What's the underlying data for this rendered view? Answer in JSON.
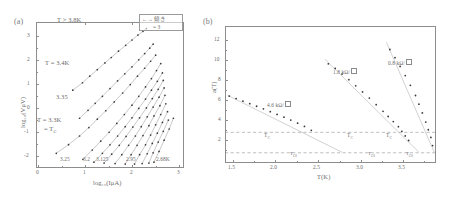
{
  "figure": {
    "panel_a_tag": "(a)",
    "panel_b_tag": "(b)"
  },
  "panel_a": {
    "xlabel": "log₁₀(IμA)",
    "ylabel": "log₁₀(VμV)",
    "xticks": [
      "0",
      "1",
      "2",
      "3"
    ],
    "yticks": [
      "3",
      "2",
      "1",
      "0",
      "-1",
      "-2"
    ],
    "annotations": {
      "top_left": "T > 3.8K",
      "upper": "T = 3.4K",
      "mid": "3.35",
      "lower_1": "T = 3.3K",
      "lower_2": "= T",
      "lower_2_sub": "C"
    },
    "curve_labels": [
      "3.25",
      "3.2",
      "3.125",
      "2.95",
      "2.68K"
    ],
    "legend": {
      "arrow_label": "←→ 傾き",
      "slope_value": "= 3"
    }
  },
  "panel_b": {
    "xlabel": "T(K)",
    "ylabel": "a(T)",
    "xticks": [
      "1.5",
      "2.0",
      "2.5",
      "3.0",
      "3.5"
    ],
    "yticks": [
      "12",
      "10",
      "8",
      "6",
      "4",
      "2"
    ],
    "series_labels": [
      "4.6 kΩ/",
      "1.8 kΩ/",
      "0.8 kΩ/"
    ],
    "markers": {
      "tc": "T",
      "tc_sub": "C",
      "tc0": "T",
      "tc0_sub": "C0"
    },
    "reference_lines": {
      "upper_value": "3",
      "lower_value": "1"
    }
  },
  "chart_data": [
    {
      "type": "line",
      "panel": "a",
      "title": "",
      "xlabel": "log10(I uA)",
      "ylabel": "log10(V uV)",
      "xlim": [
        -0.15,
        3.35
      ],
      "ylim": [
        -2.55,
        3.7
      ],
      "grid": false,
      "legend": "top-right",
      "note": "Log-log current-voltage isotherms; slope = 3 reference indicated in legend box",
      "series": [
        {
          "name": "T = 3.4K",
          "x": [
            0.72,
            0.95,
            1.12,
            1.3,
            1.48,
            1.63,
            1.8,
            1.97,
            2.12,
            2.26,
            2.38,
            2.46
          ],
          "y": [
            0.78,
            1.1,
            1.38,
            1.66,
            1.95,
            2.18,
            2.45,
            2.7,
            2.93,
            3.14,
            3.3,
            3.42
          ]
        },
        {
          "name": "3.35",
          "x": [
            0.88,
            1.08,
            1.25,
            1.42,
            1.6,
            1.78,
            1.95,
            2.12,
            2.28,
            2.42,
            2.54,
            2.62
          ],
          "y": [
            -0.42,
            -0.08,
            0.22,
            0.52,
            0.85,
            1.18,
            1.48,
            1.78,
            2.08,
            2.35,
            2.58,
            2.75
          ]
        },
        {
          "name": "T = 3.3K",
          "x": [
            0.33,
            0.62,
            0.88,
            1.1,
            1.3,
            1.5,
            1.7,
            1.9,
            2.08,
            2.25,
            2.42,
            2.56,
            2.68
          ],
          "y": [
            -1.92,
            -1.55,
            -1.18,
            -0.82,
            -0.46,
            -0.1,
            0.28,
            0.66,
            1.02,
            1.38,
            1.72,
            2.02,
            2.28
          ]
        },
        {
          "name": "3.25",
          "x": [
            0.96,
            1.18,
            1.38,
            1.58,
            1.76,
            1.94,
            2.12,
            2.28,
            2.44,
            2.58,
            2.7,
            2.8
          ],
          "y": [
            -2.18,
            -1.78,
            -1.4,
            -1.02,
            -0.64,
            -0.26,
            0.14,
            0.52,
            0.92,
            1.28,
            1.62,
            1.92
          ]
        },
        {
          "name": "3.2",
          "x": [
            1.22,
            1.42,
            1.6,
            1.78,
            1.96,
            2.12,
            2.28,
            2.44,
            2.58,
            2.72,
            2.84
          ],
          "y": [
            -2.3,
            -1.92,
            -1.56,
            -1.18,
            -0.78,
            -0.4,
            0.0,
            0.4,
            0.78,
            1.16,
            1.52
          ]
        },
        {
          "name": "3.125",
          "x": [
            1.46,
            1.64,
            1.82,
            1.98,
            2.14,
            2.3,
            2.46,
            2.6,
            2.74,
            2.86
          ],
          "y": [
            -2.34,
            -1.96,
            -1.58,
            -1.2,
            -0.8,
            -0.4,
            0.02,
            0.42,
            0.82,
            1.2
          ]
        },
        {
          "name": "3.05",
          "x": [
            1.72,
            1.88,
            2.04,
            2.2,
            2.34,
            2.48,
            2.62,
            2.76,
            2.88
          ],
          "y": [
            -2.36,
            -1.98,
            -1.58,
            -1.18,
            -0.78,
            -0.36,
            0.06,
            0.48,
            0.88
          ]
        },
        {
          "name": "2.95",
          "x": [
            1.96,
            2.1,
            2.24,
            2.38,
            2.52,
            2.64,
            2.78,
            2.9
          ],
          "y": [
            -2.38,
            -1.98,
            -1.58,
            -1.16,
            -0.74,
            -0.32,
            0.12,
            0.56
          ]
        },
        {
          "name": "2.88",
          "x": [
            2.18,
            2.3,
            2.44,
            2.56,
            2.68,
            2.8,
            2.92
          ],
          "y": [
            -2.38,
            -1.98,
            -1.56,
            -1.14,
            -0.7,
            -0.26,
            0.2
          ]
        },
        {
          "name": "2.80",
          "x": [
            2.36,
            2.48,
            2.6,
            2.72,
            2.84,
            2.96
          ],
          "y": [
            -2.36,
            -1.94,
            -1.5,
            -1.06,
            -0.6,
            -0.14
          ]
        },
        {
          "name": "2.74",
          "x": [
            2.52,
            2.62,
            2.74,
            2.86,
            2.98
          ],
          "y": [
            -2.34,
            -1.9,
            -1.44,
            -0.98,
            -0.5
          ]
        },
        {
          "name": "2.68K",
          "x": [
            2.64,
            2.76,
            2.88,
            3.0,
            3.1
          ],
          "y": [
            -2.3,
            -1.84,
            -1.36,
            -0.88,
            -0.42
          ]
        }
      ]
    },
    {
      "type": "scatter",
      "panel": "b",
      "title": "",
      "xlabel": "T(K)",
      "ylabel": "a(T)",
      "xlim": [
        1.25,
        3.72
      ],
      "ylim": [
        0.0,
        13.4
      ],
      "grid": false,
      "legend": "inline-labels",
      "hlines": [
        3,
        1
      ],
      "series": [
        {
          "name": "4.6 kΩ/sq",
          "x": [
            1.3,
            1.38,
            1.46,
            1.54,
            1.62,
            1.7,
            1.78,
            1.86,
            1.94,
            2.02,
            2.1,
            2.18,
            2.26
          ],
          "y": [
            6.55,
            6.3,
            6.05,
            5.8,
            5.55,
            5.3,
            5.02,
            4.75,
            4.48,
            4.2,
            3.9,
            3.58,
            3.2
          ]
        },
        {
          "name": "1.8 kΩ/sq",
          "x": [
            2.46,
            2.54,
            2.62,
            2.7,
            2.78,
            2.86,
            2.94,
            3.02,
            3.1,
            3.16,
            3.22,
            3.28,
            3.32,
            3.36,
            3.4
          ],
          "y": [
            9.7,
            9.25,
            8.7,
            8.15,
            7.55,
            6.95,
            6.35,
            5.7,
            5.05,
            4.55,
            4.05,
            3.55,
            3.1,
            2.65,
            2.2
          ]
        },
        {
          "name": "0.8 kΩ/sq",
          "x": [
            3.18,
            3.24,
            3.3,
            3.36,
            3.42,
            3.48,
            3.52,
            3.56,
            3.6,
            3.63,
            3.66,
            3.68
          ],
          "y": [
            11.1,
            10.3,
            9.45,
            8.55,
            7.6,
            6.6,
            5.75,
            4.9,
            4.0,
            3.25,
            2.5,
            1.7
          ]
        }
      ],
      "fit_lines": [
        {
          "name": "4.6 kΩ/sq fit",
          "x": [
            1.28,
            2.62
          ],
          "y": [
            6.62,
            1.05
          ]
        },
        {
          "name": "1.8 kΩ/sq fit",
          "x": [
            2.42,
            3.52
          ],
          "y": [
            10.15,
            1.05
          ]
        },
        {
          "name": "0.8 kΩ/sq fit",
          "x": [
            3.14,
            3.7
          ],
          "y": [
            11.8,
            1.05
          ]
        }
      ],
      "tc_points": [
        {
          "x": 2.3,
          "y": 3.0
        },
        {
          "x": 3.3,
          "y": 3.0
        },
        {
          "x": 3.58,
          "y": 3.0
        }
      ],
      "tc0_points": [
        {
          "x": 2.62,
          "y": 1.0
        },
        {
          "x": 3.52,
          "y": 1.0
        },
        {
          "x": 3.7,
          "y": 1.0
        }
      ]
    }
  ]
}
